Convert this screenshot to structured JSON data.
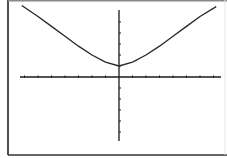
{
  "chart_data": {
    "type": "line",
    "title": "",
    "xlabel": "",
    "ylabel": "",
    "xlim": [
      -7.5,
      7.5
    ],
    "ylim": [
      -5.7,
      7.0
    ],
    "x_ticks_step": 1,
    "y_ticks_step": 1,
    "grid": false,
    "series": [
      {
        "name": "y = f(x)",
        "x": [
          -7.2,
          -6,
          -5,
          -4,
          -3,
          -2,
          -1,
          0,
          1,
          2,
          3,
          4,
          5,
          6,
          7.2
        ],
        "values": [
          6.5,
          5.5,
          4.6,
          3.7,
          2.8,
          2.0,
          1.35,
          1.0,
          1.35,
          2.0,
          2.8,
          3.7,
          4.6,
          5.5,
          6.4
        ]
      }
    ]
  },
  "colors": {
    "background": "#ffffff",
    "axes": "#1a1a1a",
    "curve": "#2a2a2a",
    "frame": "#333333"
  }
}
